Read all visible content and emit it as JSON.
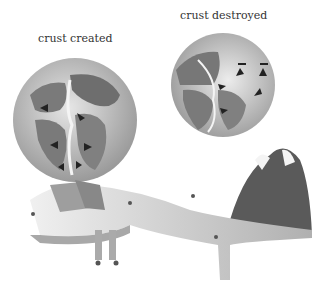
{
  "labels": {
    "left_globe": "crust created",
    "right_globe": "crust destroyed"
  },
  "colors": {
    "background": "#ffffff",
    "ocean": "#c8c8c8",
    "land": "#7a7a7a",
    "rift": "#f4f4f4",
    "arrow": "#222222",
    "mountain_dark": "#5a5a5a",
    "slab": "#bcbcbc"
  },
  "diagram": {
    "title": "",
    "globes": [
      {
        "id": "left",
        "label": "crust created",
        "arrows": 6
      },
      {
        "id": "right",
        "label": "crust destroyed",
        "arrows": 7
      }
    ]
  }
}
